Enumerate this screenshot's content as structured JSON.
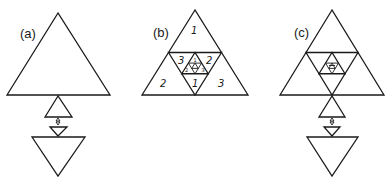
{
  "panels": [
    {
      "id": "a",
      "label": "(a)"
    },
    {
      "id": "b",
      "label": "(b)",
      "region_numbers": {
        "top": "1",
        "bottom_left": "2",
        "bottom_right": "3",
        "inner_left": "3",
        "inner_right": "2",
        "inner_bottom": "1",
        "innermost_top": "1",
        "innermost_left": "2",
        "innermost_right": "3"
      }
    },
    {
      "id": "c",
      "label": "(c)"
    }
  ],
  "colors": {
    "stroke": "#1a1a1a",
    "background": "#ffffff"
  }
}
